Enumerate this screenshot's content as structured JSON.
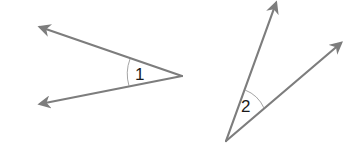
{
  "diagram": {
    "type": "angle-pair",
    "colors": {
      "ray": "#7d7d7d",
      "arc": "#9a9a9a",
      "label": "#1a1a1a",
      "background": "#ffffff"
    },
    "angles": [
      {
        "label": "1",
        "vertex": [
          182,
          76
        ],
        "rays": [
          {
            "tip": [
              38,
              26
            ]
          },
          {
            "tip": [
              38,
              105
            ]
          }
        ],
        "opening": "left"
      },
      {
        "label": "2",
        "vertex": [
          226,
          141
        ],
        "rays": [
          {
            "tip": [
              277,
              1
            ]
          },
          {
            "tip": [
              343,
              42
            ]
          }
        ],
        "opening": "up-right"
      }
    ]
  }
}
